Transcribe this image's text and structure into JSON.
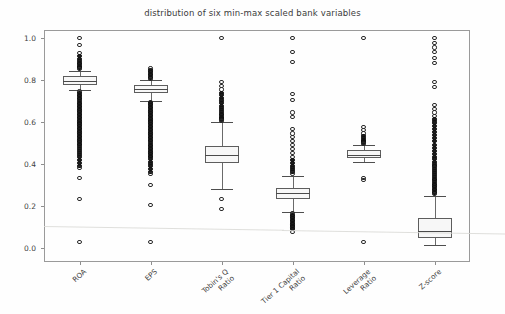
{
  "chart_data": {
    "type": "box",
    "title": "distribution of six min-max scaled bank variables",
    "xlabel": "",
    "ylabel": "",
    "ylim": [
      -0.03,
      1.06
    ],
    "yticks": [
      "0.0",
      "0.2",
      "0.4",
      "0.6",
      "0.8",
      "1.0"
    ],
    "ytick_values": [
      0.0,
      0.2,
      0.4,
      0.6,
      0.8,
      1.0
    ],
    "grid": false,
    "legend": "none",
    "categories": [
      "ROA",
      "EPS",
      "Tobin's Q\nRatio",
      "Tier 1 Capital\nRatio",
      "Leverage\nRatio",
      "Z-score"
    ],
    "boxes": [
      {
        "name": "ROA",
        "q1": 0.775,
        "median": 0.795,
        "q3": 0.818,
        "whisker_low": 0.752,
        "whisker_high": 0.845,
        "outliers_high": [
          1.0,
          0.968,
          0.93,
          0.915,
          0.9,
          0.89,
          0.882,
          0.875,
          0.868,
          0.862,
          0.856,
          0.852
        ],
        "outliers_low": [
          0.745,
          0.738,
          0.73,
          0.722,
          0.715,
          0.708,
          0.7,
          0.692,
          0.685,
          0.678,
          0.67,
          0.662,
          0.655,
          0.648,
          0.64,
          0.632,
          0.625,
          0.618,
          0.61,
          0.602,
          0.595,
          0.588,
          0.58,
          0.572,
          0.565,
          0.558,
          0.55,
          0.542,
          0.535,
          0.528,
          0.52,
          0.512,
          0.505,
          0.497,
          0.49,
          0.482,
          0.472,
          0.462,
          0.452,
          0.442,
          0.432,
          0.418,
          0.405,
          0.392,
          0.38,
          0.332,
          0.235,
          0.03
        ]
      },
      {
        "name": "EPS",
        "q1": 0.738,
        "median": 0.757,
        "q3": 0.778,
        "whisker_low": 0.7,
        "whisker_high": 0.8,
        "outliers_high": [
          0.855,
          0.845,
          0.838,
          0.83,
          0.822,
          0.815,
          0.81,
          0.805
        ],
        "outliers_low": [
          0.695,
          0.688,
          0.68,
          0.672,
          0.665,
          0.658,
          0.65,
          0.642,
          0.635,
          0.628,
          0.62,
          0.612,
          0.605,
          0.598,
          0.59,
          0.582,
          0.575,
          0.568,
          0.56,
          0.552,
          0.545,
          0.538,
          0.53,
          0.522,
          0.515,
          0.508,
          0.5,
          0.492,
          0.485,
          0.478,
          0.47,
          0.462,
          0.455,
          0.448,
          0.44,
          0.432,
          0.422,
          0.41,
          0.4,
          0.392,
          0.378,
          0.362,
          0.352,
          0.3,
          0.205,
          0.03
        ]
      },
      {
        "name": "Tobin's Q Ratio",
        "q1": 0.405,
        "median": 0.445,
        "q3": 0.487,
        "whisker_low": 0.282,
        "whisker_high": 0.6,
        "outliers_high": [
          1.0,
          0.79,
          0.772,
          0.755,
          0.74,
          0.728,
          0.715,
          0.702,
          0.69,
          0.678,
          0.668,
          0.658,
          0.648,
          0.64,
          0.632,
          0.625,
          0.618,
          0.612,
          0.606
        ],
        "outliers_low": [
          0.235,
          0.185
        ]
      },
      {
        "name": "Tier 1 Capital Ratio",
        "q1": 0.235,
        "median": 0.262,
        "q3": 0.288,
        "whisker_low": 0.172,
        "whisker_high": 0.345,
        "outliers_high": [
          1.0,
          0.935,
          0.885,
          0.735,
          0.705,
          0.645,
          0.625,
          0.565,
          0.545,
          0.528,
          0.51,
          0.492,
          0.47,
          0.452,
          0.435,
          0.42,
          0.405,
          0.392,
          0.382,
          0.372,
          0.362,
          0.355
        ],
        "outliers_low": [
          0.165,
          0.158,
          0.15,
          0.142,
          0.135,
          0.128,
          0.12,
          0.112,
          0.105,
          0.098,
          0.09,
          0.078
        ]
      },
      {
        "name": "Leverage Ratio",
        "q1": 0.428,
        "median": 0.445,
        "q3": 0.465,
        "whisker_low": 0.408,
        "whisker_high": 0.492,
        "outliers_high": [
          1.0,
          0.578,
          0.562,
          0.545,
          0.532,
          0.522,
          0.515,
          0.508,
          0.502,
          0.497
        ],
        "outliers_low": [
          0.332,
          0.322,
          0.03
        ]
      },
      {
        "name": "Z-score",
        "q1": 0.048,
        "median": 0.082,
        "q3": 0.145,
        "whisker_low": 0.012,
        "whisker_high": 0.248,
        "outliers_high": [
          1.0,
          0.978,
          0.955,
          0.932,
          0.905,
          0.882,
          0.79,
          0.768,
          0.68,
          0.662,
          0.645,
          0.628,
          0.612,
          0.598,
          0.582,
          0.568,
          0.552,
          0.538,
          0.522,
          0.508,
          0.492,
          0.478,
          0.462,
          0.448,
          0.435,
          0.422,
          0.41,
          0.398,
          0.388,
          0.378,
          0.368,
          0.358,
          0.348,
          0.338,
          0.33,
          0.322,
          0.314,
          0.306,
          0.298,
          0.29,
          0.282,
          0.275,
          0.268,
          0.262,
          0.256
        ],
        "outliers_low": []
      }
    ]
  },
  "axis": {
    "ytick_labels": [
      "1.0",
      "0.8",
      "0.6",
      "0.4",
      "0.2",
      "0.0"
    ],
    "xtick_labels": [
      "ROA",
      "EPS",
      "Tobin's Q\nRatio",
      "Tier 1 Capital\nRatio",
      "Leverage\nRatio",
      "Z-score"
    ]
  },
  "colors": {
    "box_edge": "#5d5d5d",
    "box_fill": "#f7f7f7",
    "median": "#4a4a4a",
    "whisker": "#6a6a6a",
    "outlier": "#2a2a2a",
    "frame": "#9a9a9a",
    "text": "#3f3f3f",
    "background": "#fefefe"
  }
}
